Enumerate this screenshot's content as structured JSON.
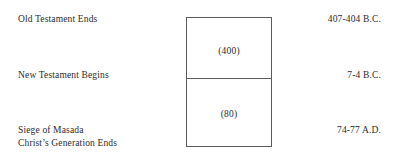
{
  "diagram": {
    "type": "timeline-interval",
    "events": [
      {
        "id": "old-testament-ends",
        "lines": [
          "Old Testament Ends"
        ],
        "date": "407-404 B.C."
      },
      {
        "id": "new-testament-begins",
        "lines": [
          "New Testament Begins"
        ],
        "date": "7-4 B.C."
      },
      {
        "id": "siege-of-masada",
        "lines": [
          "Siege of Masada",
          "Christ’s Generation Ends"
        ],
        "date": "74-77 A.D."
      }
    ],
    "segments": [
      {
        "id": "intertestamental-period",
        "value": "(400)"
      },
      {
        "id": "new-testament-period",
        "value": "(80)"
      }
    ],
    "colors": {
      "text": "#2b2b2b",
      "border": "#5b5b5b",
      "background": "#ffffff"
    }
  }
}
